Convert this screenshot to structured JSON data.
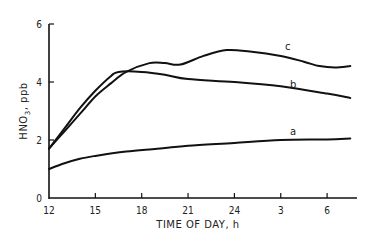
{
  "chart_data": {
    "type": "line",
    "title": "",
    "xlabel": "TIME OF DAY, h",
    "ylabel": "HNO3, ppb",
    "x_tick_labels": [
      "12",
      "15",
      "18",
      "21",
      "24",
      "3",
      "6"
    ],
    "x_tick_hours_elapsed": [
      0,
      3,
      6,
      9,
      12,
      15,
      18
    ],
    "y_tick_labels": [
      "0",
      "2",
      "4",
      "6"
    ],
    "ylim": [
      0,
      6
    ],
    "xlim_hours_elapsed": [
      0,
      20
    ],
    "grid": false,
    "legend": "inline curve labels",
    "series": [
      {
        "name": "a",
        "x_hours_elapsed": [
          0,
          1,
          2,
          3,
          5,
          7,
          9,
          12,
          15,
          18,
          19.5
        ],
        "values": [
          1.0,
          1.2,
          1.35,
          1.45,
          1.6,
          1.7,
          1.8,
          1.9,
          2.0,
          2.02,
          2.05
        ]
      },
      {
        "name": "b",
        "x_hours_elapsed": [
          0,
          1,
          2,
          3,
          4,
          4.5,
          6,
          7.5,
          9,
          12,
          15,
          18,
          19.5
        ],
        "values": [
          1.7,
          2.4,
          3.1,
          3.7,
          4.2,
          4.35,
          4.35,
          4.25,
          4.1,
          4.0,
          3.85,
          3.6,
          3.45
        ]
      },
      {
        "name": "c",
        "x_hours_elapsed": [
          0,
          1,
          2,
          3,
          4,
          5,
          6.5,
          7.5,
          8.5,
          10,
          11.5,
          13,
          15,
          16.5,
          17.5,
          18.5,
          19.5
        ],
        "values": [
          1.7,
          2.3,
          2.9,
          3.5,
          3.95,
          4.35,
          4.65,
          4.65,
          4.6,
          4.9,
          5.1,
          5.05,
          4.9,
          4.7,
          4.55,
          4.5,
          4.55
        ]
      }
    ]
  },
  "axes": {
    "ylabel_main": "HNO",
    "ylabel_sub": "3",
    "ylabel_unit": ", ppb",
    "xlabel": "TIME OF DAY, h"
  },
  "curve_labels": {
    "a": "a",
    "b": "b",
    "c": "c"
  }
}
